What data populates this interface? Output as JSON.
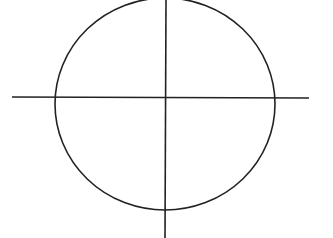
{
  "diagram": {
    "stroke_color": "#222222",
    "background": "#ffffff",
    "circle": {
      "cx": 165,
      "cy": 104,
      "rx": 110,
      "ry": 106
    },
    "horizontal_axis": {
      "x1": 12,
      "y1": 97,
      "x2": 309,
      "y2": 98
    },
    "vertical_axis": {
      "x1": 166,
      "y1": 0,
      "x2": 165,
      "y2": 238
    }
  }
}
